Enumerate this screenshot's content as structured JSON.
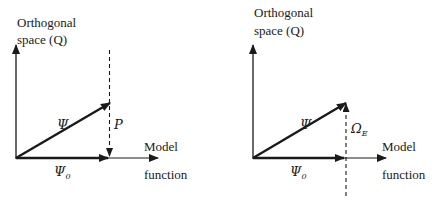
{
  "left_diagram": {
    "y_axis_label_line1": "Orthogonal",
    "y_axis_label_line2": "space (Q)",
    "x_axis_label_line1": "Model",
    "x_axis_label_line2": "function",
    "vector_psi": "Ψ",
    "vector_psi0_base": "Ψ",
    "vector_psi0_sub": "0",
    "projection_label": "P"
  },
  "right_diagram": {
    "y_axis_label_line1": "Orthogonal",
    "y_axis_label_line2": "space (Q)",
    "x_axis_label_line1": "Model",
    "x_axis_label_line2": "function",
    "vector_psi": "Ψ",
    "vector_psi0_base": "Ψ",
    "vector_psi0_sub": "0",
    "error_label_base": "Ω",
    "error_label_sub": "E"
  },
  "colors": {
    "ink": "#1a1a1a",
    "background": "#ffffff"
  }
}
